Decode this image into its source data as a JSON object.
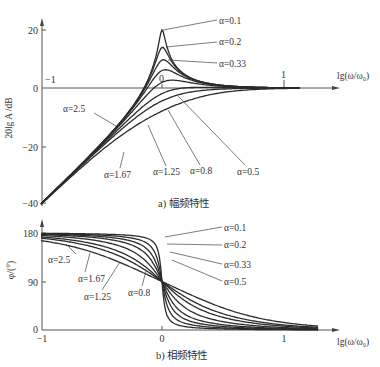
{
  "header_fragment": "(ω/ω₀ − ξ) ... ω₀",
  "chart_data": [
    {
      "type": "line",
      "title": "a) 幅频特性",
      "xlabel": "lg(ω/ω₀)",
      "ylabel": "20lg A /dB",
      "x_ticks": [
        "-1",
        "0",
        "1"
      ],
      "y_ticks": [
        "20",
        "0",
        "-20",
        "-40"
      ],
      "xlim": [
        -1,
        1.45
      ],
      "ylim": [
        -42,
        22
      ],
      "grid": false,
      "legend_position": "inline leader labels",
      "formula": "A = u² / sqrt((1-u²)² + (α·u)²), u = ω/ω₀",
      "x": [
        -1.0,
        -0.75,
        -0.5,
        -0.25,
        -0.1,
        0.0,
        0.1,
        0.25,
        0.5,
        0.75,
        1.0
      ],
      "series": [
        {
          "name": "α=0.1",
          "values": [
            -40.0,
            -30.0,
            -19.6,
            -8.4,
            -2.7,
            20.0,
            2.5,
            1.3,
            0.4,
            0.1,
            0.0
          ]
        },
        {
          "name": "α=0.2",
          "values": [
            -40.0,
            -30.0,
            -19.6,
            -8.4,
            -3.1,
            14.0,
            2.0,
            1.2,
            0.4,
            0.1,
            0.0
          ]
        },
        {
          "name": "α=0.33",
          "values": [
            -40.0,
            -30.0,
            -19.6,
            -8.5,
            -3.9,
            9.6,
            1.4,
            1.0,
            0.3,
            0.1,
            0.0
          ]
        },
        {
          "name": "α=0.5",
          "values": [
            -40.0,
            -30.0,
            -19.6,
            -8.7,
            -4.7,
            6.0,
            0.6,
            0.6,
            0.2,
            0.1,
            0.0
          ]
        },
        {
          "name": "α=0.8",
          "values": [
            -40.0,
            -30.0,
            -19.7,
            -9.2,
            -6.1,
            1.9,
            -0.8,
            -0.2,
            0.0,
            0.0,
            0.0
          ]
        },
        {
          "name": "α=1.25",
          "values": [
            -40.0,
            -30.1,
            -19.8,
            -10.0,
            -7.9,
            -1.9,
            -2.6,
            -1.2,
            -0.3,
            -0.1,
            0.0
          ]
        },
        {
          "name": "α=1.67",
          "values": [
            -40.0,
            -30.1,
            -20.0,
            -10.9,
            -9.4,
            -4.5,
            -4.0,
            -2.2,
            -0.6,
            -0.2,
            -0.1
          ]
        },
        {
          "name": "α=2.5",
          "values": [
            -40.0,
            -30.3,
            -20.5,
            -12.6,
            -12.3,
            -8.0,
            -6.4,
            -4.0,
            -1.3,
            -0.4,
            -0.1
          ]
        }
      ]
    },
    {
      "type": "line",
      "title": "b) 相频特性",
      "xlabel": "lg(ω/ω₀)",
      "ylabel": "φ/(°)",
      "x_ticks": [
        "-1",
        "0",
        "1"
      ],
      "y_ticks": [
        "180",
        "90",
        "0"
      ],
      "xlim": [
        -1,
        1.45
      ],
      "ylim": [
        0,
        185
      ],
      "grid": false,
      "formula": "φ = 180° − atan2(α·u, 1−u²)",
      "x": [
        -1.0,
        -0.5,
        -0.25,
        -0.1,
        0.0,
        0.1,
        0.25,
        0.5,
        1.0
      ],
      "series": [
        {
          "name": "α=0.1",
          "values": [
            179.4,
            178.2,
            176.5,
            172.2,
            90,
            7.8,
            3.5,
            1.8,
            0.6
          ]
        },
        {
          "name": "α=0.2",
          "values": [
            178.8,
            176.3,
            173.1,
            164.9,
            90,
            15.1,
            6.9,
            3.6,
            1.2
          ]
        },
        {
          "name": "α=0.33",
          "values": [
            178.1,
            173.9,
            168.8,
            156.1,
            90,
            23.9,
            11.2,
            6.0,
            1.9
          ]
        },
        {
          "name": "α=0.5",
          "values": [
            177.1,
            170.8,
            163.3,
            146.5,
            90,
            33.5,
            16.7,
            9.0,
            2.9
          ]
        },
        {
          "name": "α=0.8",
          "values": [
            175.4,
            165.5,
            154.5,
            133.8,
            90,
            46.2,
            25.5,
            14.5,
            4.6
          ]
        },
        {
          "name": "α=1.25",
          "values": [
            172.8,
            157.6,
            142.6,
            120.2,
            90,
            59.8,
            37.4,
            22.4,
            7.2
          ]
        },
        {
          "name": "α=1.67",
          "values": [
            170.3,
            150.5,
            132.9,
            112.9,
            90,
            67.1,
            47.1,
            29.5,
            9.7
          ]
        },
        {
          "name": "α=2.5",
          "values": [
            165.5,
            138.2,
            119.4,
            104.1,
            90,
            75.9,
            60.6,
            41.8,
            14.5
          ]
        }
      ]
    }
  ],
  "alphas": [
    0.1,
    0.2,
    0.33,
    0.5,
    0.8,
    1.25,
    1.67,
    2.5
  ],
  "mag": {
    "ylabel": "20lg A /dB",
    "y20": "20",
    "y0": "0",
    "ym20": "−20",
    "ym40": "−40",
    "xm1": "−1",
    "x0": "0",
    "x1": "1",
    "xlabel": "lg(ω/ω₀)",
    "caption": "a) 幅频特性",
    "labels": {
      "a01": "α=0.1",
      "a02": "α=0.2",
      "a033": "α=0.33",
      "a25": "α=2.5",
      "a167": "α=1.67",
      "a125": "α=1.25",
      "a08": "α=0.8",
      "a05": "α=0.5"
    }
  },
  "phase": {
    "ylabel": "φ/(°)",
    "y180": "180",
    "y90": "90",
    "y0": "0",
    "xm1": "−1",
    "x0": "0",
    "x1": "1",
    "xlabel": "lg(ω/ω₀)",
    "caption": "b) 相频特性",
    "labels": {
      "a01": "α=0.1",
      "a02": "α=0.2",
      "a033": "α=0.33",
      "a05": "α=0.5",
      "a25": "α=2.5",
      "a167": "α=1.67",
      "a125": "α=1.25",
      "a08": "α=0.8"
    }
  }
}
